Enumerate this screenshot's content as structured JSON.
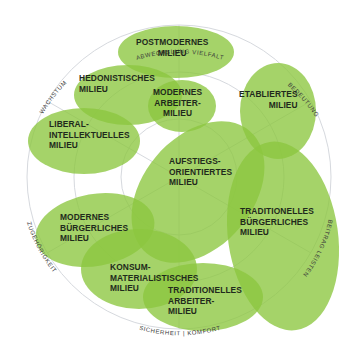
{
  "diagram": {
    "type": "milieu-map",
    "colors": {
      "ellipse_fill": "#8cc63f",
      "ellipse_opacity": 0.78,
      "overlap_dark": "#5aa83a",
      "ring_line": "#d6d9de",
      "text": "#1f2a1c"
    },
    "ring_labels": {
      "top": "ABWECHSLUNG  VIELFALT",
      "upper_right": "BEDEUTUNG",
      "right": "BEITRAG LEISTEN",
      "bottom": "SICHERHEIT | KOMFORT",
      "left": "ZUGEHÖRIGKEIT",
      "upper_left": "WACHSTUM"
    },
    "milieus": [
      {
        "id": "postmodernes",
        "lines": [
          "POSTMODERNES",
          "MILIEU"
        ]
      },
      {
        "id": "hedonistisches",
        "lines": [
          "HEDONISTISCHES",
          "MILIEU"
        ]
      },
      {
        "id": "modernes-arbeiter",
        "lines": [
          "MODERNES",
          "ARBEITER-",
          "MILIEU"
        ]
      },
      {
        "id": "etabliertes",
        "lines": [
          "ETABLIERTES",
          "MILIEU"
        ]
      },
      {
        "id": "liberal-intellektuelles",
        "lines": [
          "LIBERAL-",
          "INTELLEKTUELLES",
          "MILIEU"
        ]
      },
      {
        "id": "aufstiegsorientiertes",
        "lines": [
          "AUFSTIEGS-",
          "ORIENTIERTES",
          "MILIEU"
        ]
      },
      {
        "id": "traditionelles-buergerliches",
        "lines": [
          "TRADITIONELLES",
          "BÜRGERLICHES",
          "MILIEU"
        ]
      },
      {
        "id": "modernes-buergerliches",
        "lines": [
          "MODERNES",
          "BÜRGERLICHES",
          "MILIEU"
        ]
      },
      {
        "id": "konsum-materialistisches",
        "lines": [
          "KONSUM-",
          "MATERIALISTISCHES",
          "MILIEU"
        ]
      },
      {
        "id": "traditionelles-arbeiter",
        "lines": [
          "TRADITIONELLES",
          "ARBEITER-",
          "MILIEU"
        ]
      }
    ]
  }
}
